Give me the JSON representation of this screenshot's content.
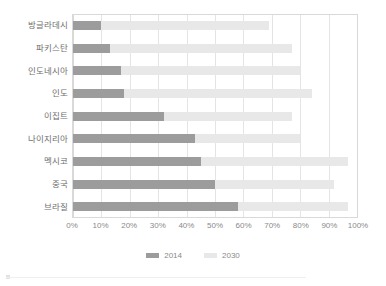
{
  "chart_data": {
    "type": "bar",
    "orientation": "horizontal",
    "title": "",
    "subtitle": "",
    "xlabel": "",
    "ylabel": "",
    "xlim": [
      0,
      100
    ],
    "xtick_labels": [
      "0%",
      "10%",
      "20%",
      "30%",
      "40%",
      "50%",
      "60%",
      "70%",
      "80%",
      "90%",
      "100%"
    ],
    "xtick_values": [
      0,
      10,
      20,
      30,
      40,
      50,
      60,
      70,
      80,
      90,
      100
    ],
    "grid": true,
    "grid_axis": "x",
    "legend_position": "bottom-center",
    "categories": [
      "방글라데시",
      "파키스탄",
      "인도네시아",
      "인도",
      "이집트",
      "나이지리아",
      "멕시코",
      "중국",
      "브라질"
    ],
    "series": [
      {
        "name": "2014",
        "color": "#9c9c9c",
        "values": [
          10,
          13,
          17,
          18,
          32,
          43,
          45,
          50,
          58
        ]
      },
      {
        "name": "2030",
        "color": "#e8e8e8",
        "values": [
          69,
          77,
          80,
          84,
          77,
          80,
          97,
          92,
          97
        ]
      }
    ]
  },
  "legend": {
    "items": [
      {
        "label": "2014",
        "color": "#9c9c9c"
      },
      {
        "label": "2030",
        "color": "#e8e8e8"
      }
    ]
  },
  "colors": {
    "series_2014": "#9c9c9c",
    "series_2030": "#e8e8e8",
    "gridline": "#e4e4e4",
    "plot_border": "#d9d9d9",
    "tick_text": "#8a8a8a",
    "category_text": "#6e6e6e",
    "background": "#ffffff"
  }
}
